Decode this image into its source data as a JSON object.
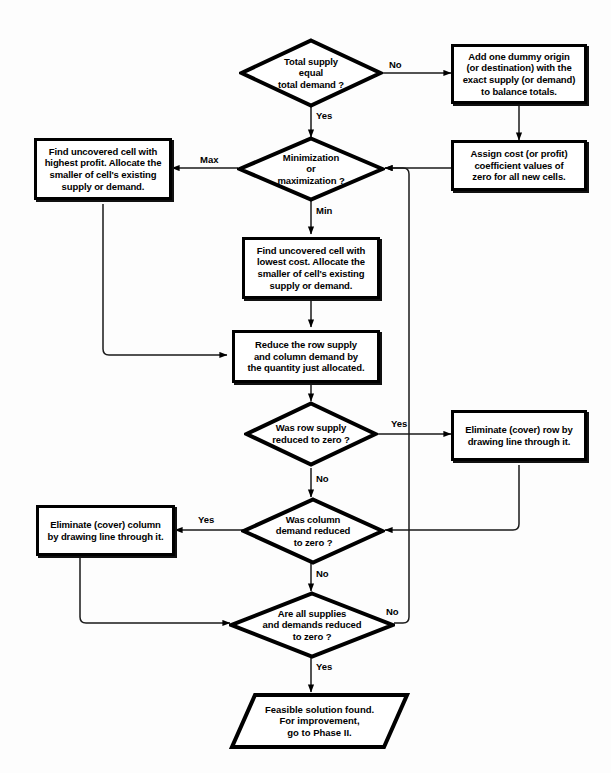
{
  "diagram": {
    "type": "flowchart",
    "colors": {
      "stroke": "#000000",
      "fill": "#ffffff",
      "background": "#fdfdfd"
    }
  },
  "nodes": {
    "total_supply": {
      "shape": "decision",
      "lines": [
        "Total supply",
        "equal",
        "total demand ?"
      ]
    },
    "add_dummy": {
      "shape": "process",
      "lines": [
        "Add one dummy origin",
        "(or destination) with the",
        "exact supply (or demand)",
        "to balance totals."
      ]
    },
    "assign_cost": {
      "shape": "process",
      "lines": [
        "Assign cost (or profit)",
        "coefficient values of",
        "zero for all new cells."
      ]
    },
    "min_or_max": {
      "shape": "decision",
      "lines": [
        "Minimization",
        "or",
        "maximization ?"
      ]
    },
    "highest_profit": {
      "shape": "process",
      "lines": [
        "Find uncovered cell with",
        "highest profit. Allocate the",
        "smaller of cell's existing",
        "supply or demand."
      ]
    },
    "lowest_cost": {
      "shape": "process",
      "lines": [
        "Find uncovered cell with",
        "lowest cost. Allocate the",
        "smaller of cell's existing",
        "supply or demand."
      ]
    },
    "reduce": {
      "shape": "process",
      "lines": [
        "Reduce the row supply",
        "and column demand by",
        "the quantity just allocated."
      ]
    },
    "row_supply_zero": {
      "shape": "decision",
      "lines": [
        "Was row supply",
        "reduced to zero ?"
      ]
    },
    "eliminate_row": {
      "shape": "process",
      "lines": [
        "Eliminate (cover) row by",
        "drawing line through it."
      ]
    },
    "column_demand_zero": {
      "shape": "decision",
      "lines": [
        "Was column",
        "demand reduced",
        "to zero ?"
      ]
    },
    "eliminate_column": {
      "shape": "process",
      "lines": [
        "Eliminate (cover) column",
        "by drawing line through it."
      ]
    },
    "all_reduced": {
      "shape": "decision",
      "lines": [
        "Are all supplies",
        "and demands reduced",
        "to zero ?"
      ]
    },
    "feasible": {
      "shape": "parallelogram",
      "lines": [
        "Feasible solution found.",
        "For improvement,",
        "go to Phase II."
      ]
    }
  },
  "edge_labels": {
    "supply_no": "No",
    "supply_yes": "Yes",
    "max": "Max",
    "min": "Min",
    "row_yes": "Yes",
    "row_no": "No",
    "col_yes": "Yes",
    "col_no": "No",
    "all_no": "No",
    "all_yes": "Yes"
  }
}
